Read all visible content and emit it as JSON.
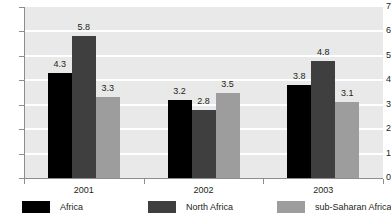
{
  "chart_data": {
    "type": "bar",
    "title": "",
    "subtitle": "",
    "xlabel": "",
    "ylabel": "",
    "categories": [
      "2001",
      "2002",
      "2003"
    ],
    "series": [
      {
        "name": "Africa",
        "color": "#000000",
        "values": [
          4.3,
          3.2,
          3.8
        ]
      },
      {
        "name": "North Africa",
        "color": "#3f3f3f",
        "values": [
          5.8,
          2.8,
          4.8
        ]
      },
      {
        "name": "sub-Saharan Africa",
        "color": "#9d9d9d",
        "values": [
          3.3,
          3.5,
          3.1
        ]
      }
    ],
    "ylim": [
      0,
      7
    ],
    "ytick_labels": [
      "0",
      "1",
      "2",
      "3",
      "4",
      "5",
      "6",
      "7"
    ],
    "ytick_values": [
      0,
      1,
      2,
      3,
      4,
      5,
      6,
      7
    ],
    "grid": true,
    "grid_color": "#ffffff",
    "plot_background": "#e9e9e9",
    "axis_color": "#8d8d8d",
    "legend_position": "bottom",
    "data_labels": true
  }
}
